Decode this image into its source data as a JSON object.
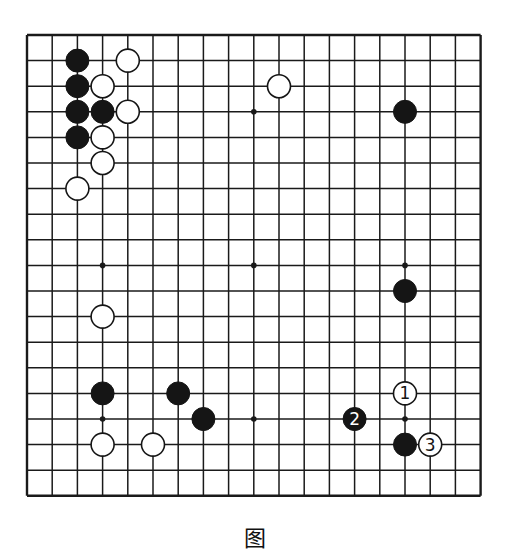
{
  "board": {
    "size": 19,
    "origin_x": 27,
    "origin_y": 35,
    "spacing_x": 25.2,
    "spacing_y": 25.6,
    "line_color": "#1a1a1a",
    "stone_radius": 11.5,
    "star_points": [
      [
        3,
        3
      ],
      [
        9,
        3
      ],
      [
        15,
        3
      ],
      [
        3,
        9
      ],
      [
        9,
        9
      ],
      [
        15,
        9
      ],
      [
        3,
        15
      ],
      [
        9,
        15
      ],
      [
        15,
        15
      ]
    ],
    "stones": [
      {
        "color": "black",
        "col": 2,
        "row": 1
      },
      {
        "color": "black",
        "col": 2,
        "row": 2
      },
      {
        "color": "black",
        "col": 2,
        "row": 3
      },
      {
        "color": "black",
        "col": 3,
        "row": 3
      },
      {
        "color": "black",
        "col": 2,
        "row": 4
      },
      {
        "color": "black",
        "col": 15,
        "row": 3
      },
      {
        "color": "black",
        "col": 15,
        "row": 10
      },
      {
        "color": "black",
        "col": 3,
        "row": 14
      },
      {
        "color": "black",
        "col": 6,
        "row": 14
      },
      {
        "color": "black",
        "col": 7,
        "row": 15
      },
      {
        "color": "black",
        "col": 15,
        "row": 16
      },
      {
        "color": "black",
        "col": 13,
        "row": 15,
        "label": "2"
      },
      {
        "color": "white",
        "col": 4,
        "row": 1
      },
      {
        "color": "white",
        "col": 3,
        "row": 2
      },
      {
        "color": "white",
        "col": 4,
        "row": 3
      },
      {
        "color": "white",
        "col": 3,
        "row": 4
      },
      {
        "color": "white",
        "col": 3,
        "row": 5
      },
      {
        "color": "white",
        "col": 2,
        "row": 6
      },
      {
        "color": "white",
        "col": 10,
        "row": 2
      },
      {
        "color": "white",
        "col": 3,
        "row": 11
      },
      {
        "color": "white",
        "col": 3,
        "row": 16
      },
      {
        "color": "white",
        "col": 5,
        "row": 16
      },
      {
        "color": "white",
        "col": 15,
        "row": 14,
        "label": "1"
      },
      {
        "color": "white",
        "col": 16,
        "row": 16,
        "label": "3"
      }
    ]
  },
  "caption": "图"
}
